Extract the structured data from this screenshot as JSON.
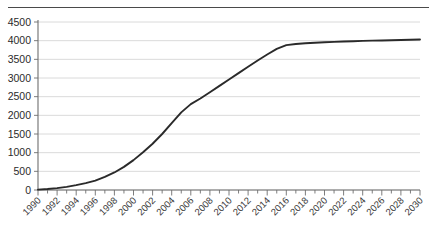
{
  "chart_data": {
    "type": "line",
    "title": "",
    "subtitle": "",
    "xlabel": "",
    "ylabel": "",
    "xlim": [
      1990,
      2030
    ],
    "ylim": [
      0,
      4500
    ],
    "grid": true,
    "legend": false,
    "y_ticks": [
      0,
      500,
      1000,
      1500,
      2000,
      2500,
      3000,
      3500,
      4000,
      4500
    ],
    "y_tick_labels": [
      "0",
      "500",
      "1000",
      "1500",
      "2000",
      "2500",
      "3000",
      "3500",
      "4000",
      "4500"
    ],
    "x_tick_labels": [
      "1990",
      "1992",
      "1994",
      "1996",
      "1998",
      "2000",
      "2002",
      "2004",
      "2006",
      "2008",
      "2010",
      "2012",
      "2014",
      "2016",
      "2018",
      "2020",
      "2022",
      "2024",
      "2026",
      "2028",
      "2030"
    ],
    "x_minor_tick_interval": 1,
    "x_label_interval": 2,
    "series": [
      {
        "name": "cumulative",
        "color": "#2a2a2a",
        "x": [
          1990,
          1991,
          1992,
          1993,
          1994,
          1995,
          1996,
          1997,
          1998,
          1999,
          2000,
          2001,
          2002,
          2003,
          2004,
          2005,
          2006,
          2007,
          2008,
          2009,
          2010,
          2011,
          2012,
          2013,
          2014,
          2015,
          2016,
          2017,
          2018,
          2019,
          2020,
          2021,
          2022,
          2023,
          2024,
          2025,
          2026,
          2027,
          2028,
          2029,
          2030
        ],
        "values": [
          10,
          25,
          50,
          85,
          130,
          185,
          250,
          350,
          470,
          620,
          800,
          1010,
          1240,
          1500,
          1790,
          2080,
          2300,
          2450,
          2620,
          2790,
          2960,
          3130,
          3300,
          3470,
          3630,
          3780,
          3880,
          3910,
          3930,
          3945,
          3958,
          3968,
          3978,
          3986,
          3994,
          4000,
          4006,
          4012,
          4018,
          4024,
          4030
        ]
      }
    ]
  },
  "axes": {
    "y_axis_name": "value-axis",
    "x_axis_name": "year-axis"
  }
}
